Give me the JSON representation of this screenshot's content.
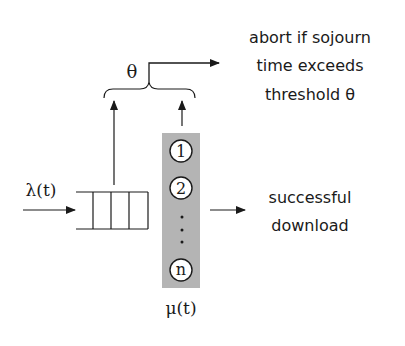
{
  "diagram": {
    "arrival_label": "λ(t)",
    "service_label": "μ(t)",
    "threshold_label": "θ",
    "abort_text": [
      "abort if sojourn",
      "time exceeds",
      "threshold θ"
    ],
    "success_text": [
      "successful",
      "download"
    ],
    "servers": [
      "1",
      "2",
      "n"
    ],
    "queue_slots": 3,
    "colors": {
      "server_panel": "#b4b4b4",
      "stroke": "#1a1a1a",
      "circle_fill": "#ffffff"
    }
  }
}
